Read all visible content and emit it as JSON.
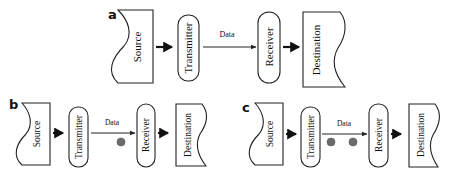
{
  "figure": {
    "panels": [
      {
        "id": "a",
        "label": "a",
        "nodes": [
          "Source",
          "Transmitter",
          "Receiver",
          "Destination"
        ],
        "channel_label": "Data",
        "packets_in_transit": 0
      },
      {
        "id": "b",
        "label": "b",
        "nodes": [
          "Source",
          "Transmitter",
          "Receiver",
          "Destination"
        ],
        "channel_label": "Data",
        "packets_in_transit": 1
      },
      {
        "id": "c",
        "label": "c",
        "nodes": [
          "Source",
          "Transmitter",
          "Receiver",
          "Destination"
        ],
        "channel_label": "Data",
        "packets_in_transit": 2
      }
    ],
    "colors": {
      "stroke": "#222222",
      "packet": "#6b6b6b",
      "background": "#ffffff"
    }
  }
}
